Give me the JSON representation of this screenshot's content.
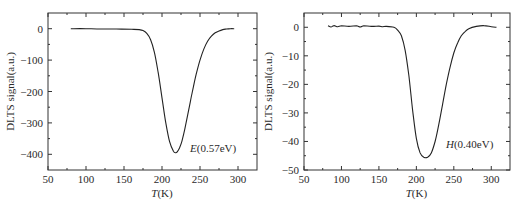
{
  "chart_data": [
    {
      "type": "line",
      "title": "",
      "xlabel_italic": "T",
      "xlabel_unit": "(K)",
      "xlabel": "T(K)",
      "ylabel": "DLTS signal(a.u.)",
      "xlim": [
        50,
        325
      ],
      "ylim": [
        -450,
        50
      ],
      "xticks": [
        50,
        100,
        150,
        200,
        250,
        300
      ],
      "xtick_labels": [
        "50",
        "100",
        "150",
        "200",
        "250",
        "300"
      ],
      "yticks": [
        0,
        -100,
        -200,
        -300,
        -400
      ],
      "ytick_labels": [
        "0",
        "−100",
        "−200",
        "−300",
        "−400"
      ],
      "annotation_italic": "E",
      "annotation_rest": "(0.57eV)",
      "annotation": "E(0.57eV)",
      "grid": false,
      "series": [
        {
          "name": "E(0.57eV)",
          "x": [
            80,
            100,
            120,
            140,
            160,
            170,
            175,
            180,
            185,
            190,
            195,
            200,
            205,
            210,
            215,
            218,
            220,
            223,
            226,
            230,
            235,
            240,
            245,
            250,
            255,
            260,
            265,
            270,
            275,
            280,
            285,
            290,
            295
          ],
          "y": [
            0,
            0,
            -1,
            -1,
            -2,
            -3,
            -6,
            -15,
            -35,
            -75,
            -140,
            -220,
            -300,
            -360,
            -390,
            -395,
            -392,
            -380,
            -360,
            -320,
            -260,
            -200,
            -145,
            -100,
            -65,
            -40,
            -24,
            -13,
            -7,
            -3,
            -1,
            0,
            0
          ]
        }
      ]
    },
    {
      "type": "line",
      "title": "",
      "xlabel_italic": "T",
      "xlabel_unit": "(K)",
      "xlabel": "T(K)",
      "ylabel": "DLTS signal(a.u.)",
      "xlim": [
        50,
        325
      ],
      "ylim": [
        -50,
        5
      ],
      "xticks": [
        50,
        100,
        150,
        200,
        250,
        300
      ],
      "xtick_labels": [
        "50",
        "100",
        "150",
        "200",
        "250",
        "300"
      ],
      "yticks": [
        0,
        -10,
        -20,
        -30,
        -40,
        -50
      ],
      "ytick_labels": [
        "0",
        "−10",
        "−20",
        "−30",
        "−40",
        "−50"
      ],
      "annotation_italic": "H",
      "annotation_rest": "(0.40eV)",
      "annotation": "H(0.40eV)",
      "grid": false,
      "series": [
        {
          "name": "H(0.40eV)",
          "x": [
            82,
            86,
            90,
            95,
            100,
            110,
            120,
            125,
            130,
            140,
            150,
            155,
            160,
            170,
            175,
            180,
            185,
            190,
            195,
            200,
            205,
            210,
            215,
            220,
            225,
            230,
            235,
            240,
            245,
            250,
            255,
            260,
            265,
            270,
            280,
            290,
            300,
            307
          ],
          "y": [
            0.5,
            0.1,
            0.6,
            0.2,
            0.5,
            0.3,
            0.5,
            0.1,
            0.5,
            0.3,
            0.4,
            0.2,
            0.3,
            0,
            -1,
            -3,
            -8,
            -17,
            -29,
            -39,
            -44,
            -45.5,
            -45.5,
            -44,
            -40,
            -34,
            -27,
            -20,
            -14,
            -9,
            -5.5,
            -3,
            -1.5,
            -0.5,
            0.3,
            0.6,
            0.2,
            0
          ]
        }
      ]
    }
  ]
}
